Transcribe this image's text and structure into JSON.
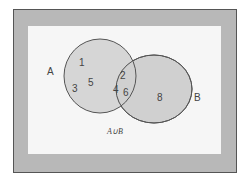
{
  "diagram": {
    "type": "venn",
    "sets": [
      {
        "name": "A",
        "label": "A",
        "elements_only": [
          "1",
          "3",
          "5"
        ]
      },
      {
        "name": "B",
        "label": "B",
        "elements_only": [
          "8"
        ]
      }
    ],
    "intersection": [
      "2",
      "4",
      "6"
    ],
    "caption": "A∪B",
    "colors": {
      "frame": "#b8b8b8",
      "background": "#f6f6f6",
      "circle_fill": "#d0d0d0",
      "circle_stroke": "#555555"
    }
  }
}
